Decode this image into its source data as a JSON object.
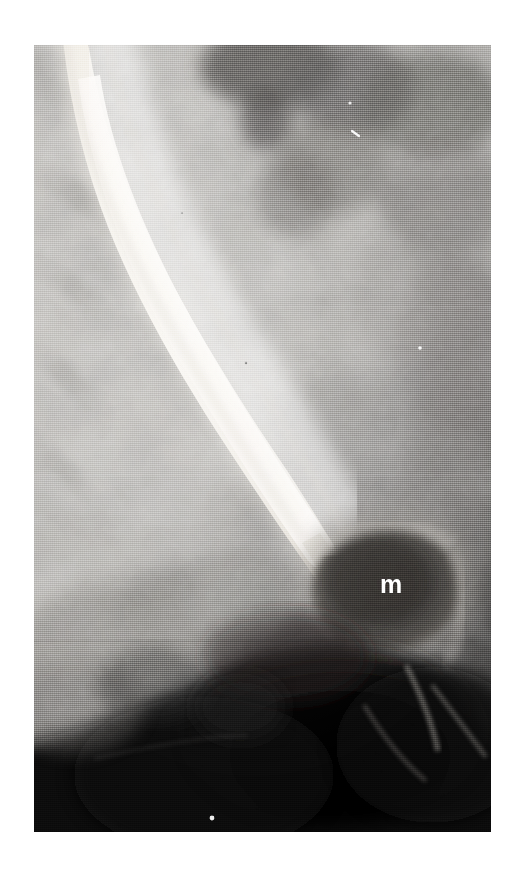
{
  "figure": {
    "kind": "radiograph",
    "modality": "barium-swallow-esophagram",
    "canvas": {
      "width": 522,
      "height": 875
    },
    "plate": {
      "x": 34,
      "y": 45,
      "width": 457,
      "height": 787
    },
    "background_color": "#ffffff"
  },
  "annotations": {
    "mass_label": {
      "text": "m",
      "color": "#ffffff",
      "x": 380,
      "y": 572,
      "font_size_px": 25,
      "weight": "bold",
      "meaning": "mass"
    }
  },
  "tones": {
    "film_base": "#b9b9b9",
    "barium_column": "#f2efe9",
    "barium_column_core": "#faf8f4",
    "soft_tissue_light": "#d2d0cc",
    "soft_tissue_mid": "#a9a7a3",
    "soft_tissue_dark": "#767472",
    "mediastinum_dark": "#5a5856",
    "mass_dark": "#3a3836",
    "gastric_gas_black": "#0b0b0b",
    "artifact_white": "#ffffff"
  },
  "regions": [
    {
      "name": "barium-filled-esophagus",
      "tone": "barium_column",
      "description": "bright contrast column curving from upper left downward to the right"
    },
    {
      "name": "tapered-distal-narrowing",
      "tone": "barium_column",
      "description": "beak-like tapering of the contrast column in the lower third"
    },
    {
      "name": "mass-lesion",
      "tone": "mass_dark",
      "description": "rounded soft-tissue density to the right of the narrowing, labelled m"
    },
    {
      "name": "gastric-gas-shadow",
      "tone": "gastric_gas_black",
      "description": "large black gas collection across the lower portion"
    },
    {
      "name": "lung-and-soft-tissue-field",
      "tone": "soft_tissue_light",
      "description": "mottled light gray parenchymal background on the left"
    },
    {
      "name": "mediastinal-density",
      "tone": "mediastinum_dark",
      "description": "darker gray densities at the upper right"
    }
  ],
  "artifacts": [
    {
      "name": "white-speck-upper",
      "x": 355,
      "y": 135,
      "size": 3
    },
    {
      "name": "white-speck-right",
      "x": 420,
      "y": 348,
      "size": 3
    },
    {
      "name": "white-speck-lower",
      "x": 212,
      "y": 818,
      "size": 4
    }
  ]
}
